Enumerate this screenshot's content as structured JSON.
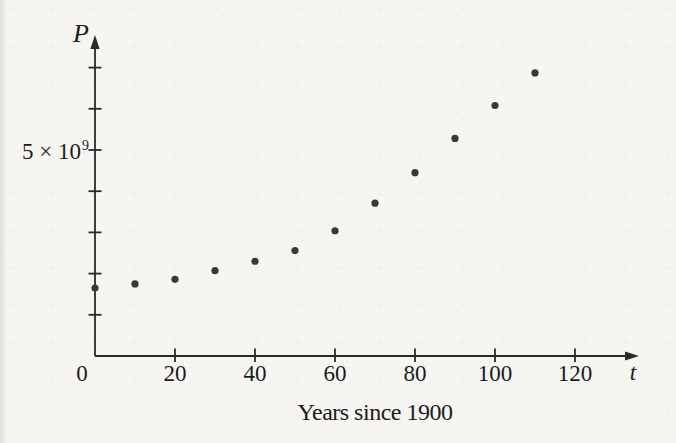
{
  "figure": {
    "background_color": "#f6f5f2",
    "ink_color": "#2a2a2a",
    "dot_color": "#383838",
    "text_color": "#1c1c1c",
    "y_axis_title": "P",
    "x_axis_title": "t",
    "y_tick_label": {
      "base": "5 × 10",
      "exp": "9"
    },
    "caption": "Years since 1900"
  },
  "chart_data": {
    "type": "scatter",
    "title": "",
    "xlabel": "Years since 1900",
    "ylabel": "P",
    "x_axis_symbol": "t",
    "y_axis_symbol": "P",
    "x": [
      0,
      10,
      20,
      30,
      40,
      50,
      60,
      70,
      80,
      90,
      100,
      110
    ],
    "y_billions": [
      1.65,
      1.75,
      1.86,
      2.07,
      2.3,
      2.56,
      3.04,
      3.71,
      4.45,
      5.28,
      6.08,
      6.87
    ],
    "x_ticks": [
      0,
      20,
      40,
      60,
      80,
      100,
      120
    ],
    "y_ticks_billions": [
      1,
      2,
      3,
      4,
      5,
      6,
      7
    ],
    "y_labeled_tick_value_billions": 5,
    "y_labeled_tick_text": "5 × 10⁹",
    "xlim": [
      0,
      133
    ],
    "ylim_billions": [
      0,
      7.8
    ],
    "grid": false,
    "legend": false
  }
}
